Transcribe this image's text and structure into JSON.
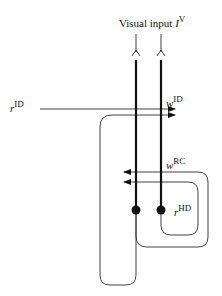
{
  "diagram": {
    "title_label": {
      "text": "Visual input",
      "symbol": "I",
      "superscript": "V"
    },
    "labels": {
      "r_id": {
        "symbol": "r",
        "superscript": "ID"
      },
      "w_id": {
        "symbol": "w",
        "superscript": "ID"
      },
      "w_rc": {
        "symbol": "w",
        "superscript": "RC"
      },
      "r_hd": {
        "symbol": "r",
        "superscript": "HD"
      }
    },
    "colors": {
      "line": "#111111",
      "background": "#ffffff"
    },
    "nodes": [
      {
        "id": "unit-left",
        "x": 136,
        "y": 210
      },
      {
        "id": "unit-right",
        "x": 161,
        "y": 210
      }
    ]
  }
}
